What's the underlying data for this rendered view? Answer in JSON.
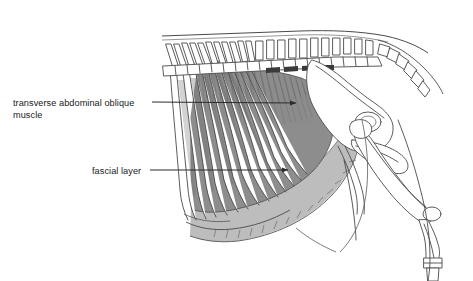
{
  "figure": {
    "background_color": "#ffffff",
    "width": 473,
    "height": 281
  },
  "labels": [
    {
      "id": "transverse-abdominal-oblique-muscle",
      "line1": "transverse abdominal oblique",
      "line2": "muscle",
      "text_x": 13,
      "text_y": 106,
      "line_height": 12,
      "leader": {
        "start_x": 152,
        "start_y": 102,
        "end_x": 300,
        "end_y": 103,
        "arrow": true
      }
    },
    {
      "id": "fascial-layer",
      "line1": "fascial layer",
      "line2": "",
      "text_x": 92,
      "text_y": 174,
      "line_height": 12,
      "leader": {
        "start_x": 150,
        "start_y": 170,
        "end_x": 292,
        "end_y": 170,
        "arrow": true
      }
    }
  ],
  "regions": {
    "transverse_abdominal_oblique_muscle": {
      "name": "transverse abdominal oblique muscle",
      "fill_color": "#8d8d8d",
      "description": "darker shaded fan-shaped muscle sheet over caudal ribs and flank"
    },
    "fascial_layer": {
      "name": "fascial layer",
      "fill_color": "#bdbdbd",
      "description": "lighter shaded sheet ventral and caudal to the oblique muscle"
    },
    "bone_outline_color": "#4a4a4a",
    "rib_shade_color": "#6e6e6e"
  },
  "anatomy_parts": [
    "thoracic vertebrae with spinous processes",
    "lumbar vertebrae with transverse processes",
    "sacrum",
    "caudal (tail) vertebrae",
    "ribs",
    "ilium",
    "ischium",
    "femur",
    "patella",
    "tibia",
    "tarsus",
    "metatarsus"
  ]
}
